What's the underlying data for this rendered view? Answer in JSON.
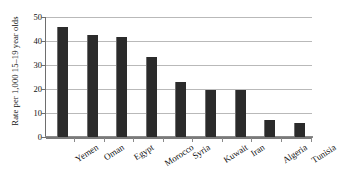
{
  "chart_data": {
    "type": "bar",
    "title": "",
    "xlabel": "",
    "ylabel": "Rate per 1,000 15–19 year olds",
    "ylim": [
      0,
      50
    ],
    "yticks": [
      0,
      10,
      20,
      30,
      40,
      50
    ],
    "grid": true,
    "legend": false,
    "categories": [
      "Yemen",
      "Oman",
      "Egypt",
      "Morocco",
      "Syria",
      "Kuwait",
      "Iran",
      "Algeria",
      "Tunisia"
    ],
    "values": [
      46,
      42.5,
      41.5,
      33.5,
      23,
      19.5,
      19.5,
      7,
      6
    ],
    "bar_color": "#2b2b2b",
    "gridline_color": "#b9b9b9",
    "axis_color": "#6e6e6e",
    "background": "#ffffff"
  }
}
